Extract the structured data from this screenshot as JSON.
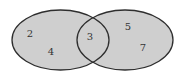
{
  "diagram": {
    "type": "venn",
    "colors": {
      "fill": "#cfcfcf",
      "outline": "#2e2e2e",
      "text": "#333333",
      "background": "#ffffff"
    },
    "sets": [
      {
        "name": "left-set",
        "cx": 60.5,
        "cy": 40,
        "rx": 48.5,
        "ry": 30
      },
      {
        "name": "right-set",
        "cx": 125,
        "cy": 40,
        "rx": 48,
        "ry": 30
      }
    ],
    "regions": {
      "left_only": [
        {
          "label": "2",
          "x": 30,
          "y": 33
        },
        {
          "label": "4",
          "x": 51,
          "y": 51
        }
      ],
      "intersection": [
        {
          "label": "3",
          "x": 90,
          "y": 36
        }
      ],
      "right_only": [
        {
          "label": "5",
          "x": 128,
          "y": 26
        },
        {
          "label": "7",
          "x": 143,
          "y": 47
        }
      ]
    }
  }
}
